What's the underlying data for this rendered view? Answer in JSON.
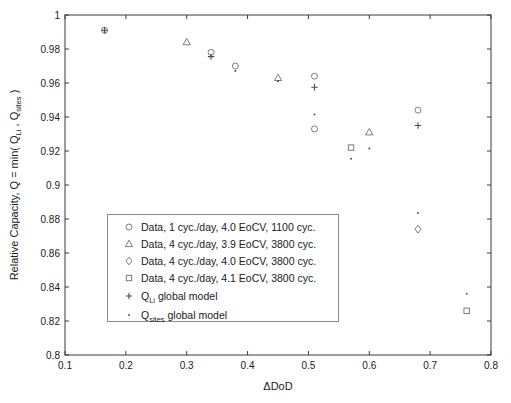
{
  "figure": {
    "background": "#ffffff",
    "axis_color": "#3a3a3a",
    "tick_label_color": "#1a1a1a",
    "xlabel": "ΔDoD",
    "ylabel_parts": [
      {
        "t": "Relative Capacity, Q = min( Q"
      },
      {
        "s": "Li"
      },
      {
        "t": " , Q"
      },
      {
        "s": "sites"
      },
      {
        "t": " )"
      }
    ]
  },
  "chart_data": {
    "type": "scatter",
    "title": "",
    "xlabel": "ΔDoD",
    "ylabel": "Relative Capacity, Q = min( Q_Li , Q_sites )",
    "xlim": [
      0.1,
      0.8
    ],
    "ylim": [
      0.8,
      1.0
    ],
    "grid": false,
    "box": true,
    "legend_position": "inside lower-left",
    "x_ticks": [
      0.1,
      0.2,
      0.3,
      0.4,
      0.5,
      0.6,
      0.7,
      0.8
    ],
    "x_tick_labels": [
      "0.1",
      "0.2",
      "0.3",
      "0.4",
      "0.5",
      "0.6",
      "0.7",
      "0.8"
    ],
    "y_ticks": [
      0.8,
      0.82,
      0.84,
      0.86,
      0.88,
      0.9,
      0.92,
      0.94,
      0.96,
      0.98,
      1.0
    ],
    "y_tick_labels": [
      "0.8",
      "0.82",
      "0.84",
      "0.86",
      "0.88",
      "0.9",
      "0.92",
      "0.94",
      "0.96",
      "0.98",
      "1"
    ],
    "series": [
      {
        "name": "Data, 1 cyc./day, 4.0 EoCV, 1100 cyc.",
        "marker": "circle",
        "color": "#6e6e6e",
        "points": [
          [
            0.165,
            0.991
          ],
          [
            0.34,
            0.978
          ],
          [
            0.38,
            0.97
          ],
          [
            0.51,
            0.964
          ],
          [
            0.51,
            0.933
          ],
          [
            0.68,
            0.944
          ]
        ]
      },
      {
        "name": "Data, 4 cyc./day, 3.9 EoCV, 3800 cyc.",
        "marker": "triangle",
        "color": "#6e6e6e",
        "points": [
          [
            0.3,
            0.984
          ],
          [
            0.45,
            0.963
          ],
          [
            0.6,
            0.931
          ]
        ]
      },
      {
        "name": "Data, 4 cyc./day, 4.0 EoCV, 3800 cyc.",
        "marker": "diamond",
        "color": "#6e6e6e",
        "points": [
          [
            0.68,
            0.874
          ]
        ]
      },
      {
        "name": "Data, 4 cyc./day, 4.1 EoCV, 3800 cyc.",
        "marker": "square",
        "color": "#6e6e6e",
        "points": [
          [
            0.57,
            0.922
          ],
          [
            0.76,
            0.826
          ]
        ]
      },
      {
        "name": "Q_Li global model",
        "marker": "plus",
        "color": "#4a4a4a",
        "points": [
          [
            0.165,
            0.991
          ],
          [
            0.34,
            0.9755
          ],
          [
            0.51,
            0.9575
          ],
          [
            0.68,
            0.935
          ]
        ]
      },
      {
        "name": "Q_sites global model",
        "marker": "dot",
        "color": "#555555",
        "points": [
          [
            0.165,
            0.99
          ],
          [
            0.38,
            0.967
          ],
          [
            0.45,
            0.961
          ],
          [
            0.51,
            0.9415
          ],
          [
            0.57,
            0.9155
          ],
          [
            0.6,
            0.9215
          ],
          [
            0.68,
            0.8835
          ],
          [
            0.76,
            0.836
          ]
        ]
      }
    ]
  },
  "legend": {
    "entries": [
      {
        "marker": "circle",
        "parts": [
          {
            "t": "Data, 1 cyc./day, 4.0 EoCV, 1100 cyc."
          }
        ]
      },
      {
        "marker": "triangle",
        "parts": [
          {
            "t": "Data, 4 cyc./day, 3.9 EoCV, 3800 cyc."
          }
        ]
      },
      {
        "marker": "diamond",
        "parts": [
          {
            "t": "Data, 4 cyc./day, 4.0 EoCV, 3800 cyc."
          }
        ]
      },
      {
        "marker": "square",
        "parts": [
          {
            "t": "Data, 4 cyc./day, 4.1 EoCV, 3800 cyc."
          }
        ]
      },
      {
        "marker": "plus",
        "parts": [
          {
            "t": "Q"
          },
          {
            "s": "Li"
          },
          {
            "t": " global model"
          }
        ]
      },
      {
        "marker": "dot",
        "parts": [
          {
            "t": "Q"
          },
          {
            "s": "sites"
          },
          {
            "t": " global model"
          }
        ]
      }
    ]
  }
}
